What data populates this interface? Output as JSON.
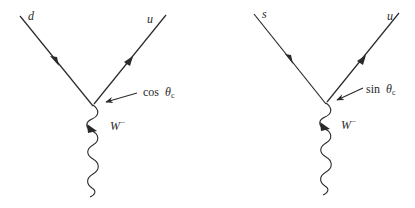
{
  "diagrams": [
    {
      "id": "d-to-u",
      "incoming_quark": "d",
      "outgoing_quark": "u",
      "coupling_label_fn": "cos",
      "coupling_label_theta": "θ",
      "coupling_label_sub": "c",
      "boson_label": "W",
      "boson_charge": "−"
    },
    {
      "id": "s-to-u",
      "incoming_quark": "s",
      "outgoing_quark": "u",
      "coupling_label_fn": "sin",
      "coupling_label_theta": "θ",
      "coupling_label_sub": "c",
      "boson_label": "W",
      "boson_charge": "−"
    }
  ],
  "colors": {
    "line": "#2a2a2a",
    "background": "#ffffff"
  }
}
